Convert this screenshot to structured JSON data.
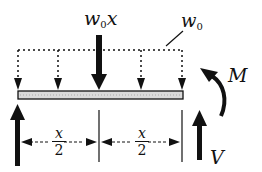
{
  "diagram": {
    "type": "free-body diagram of beam segment",
    "labels": {
      "resultant_main": "w",
      "resultant_sub": "0",
      "resultant_suffix": "x",
      "distributed_main": "w",
      "distributed_sub": "0",
      "moment": "M",
      "shear": "V",
      "dim_left_num": "x",
      "dim_left_den": "2",
      "dim_right_num": "x",
      "dim_right_den": "2"
    },
    "colors": {
      "ink": "#111111",
      "beam_fill": "#d9d9d9",
      "background": "#ffffff"
    }
  }
}
